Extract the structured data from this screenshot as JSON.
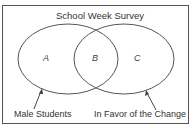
{
  "diagram": {
    "title": "School Week Survey",
    "type": "venn",
    "sets": [
      {
        "name": "Male Students",
        "region_label": "A"
      },
      {
        "name": "In Favor of the Change",
        "region_label": "C"
      }
    ],
    "intersection_label": "B",
    "stroke_color": "#555555"
  }
}
